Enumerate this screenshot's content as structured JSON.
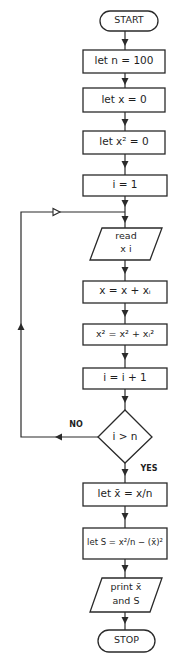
{
  "diagram": {
    "type": "flowchart",
    "title": "",
    "colors": {
      "stroke": "#2a2a2a",
      "fill": "#ffffff",
      "text": "#1e1e1e"
    },
    "nodes": [
      {
        "id": "start",
        "shape": "terminator",
        "label": "START"
      },
      {
        "id": "n",
        "shape": "process",
        "label": "let n = 100"
      },
      {
        "id": "x0",
        "shape": "process",
        "label": "let x = 0"
      },
      {
        "id": "x2_0",
        "shape": "process",
        "label": "let x² = 0"
      },
      {
        "id": "i1",
        "shape": "process",
        "label": "i = 1"
      },
      {
        "id": "read",
        "shape": "io",
        "label_line1": "read",
        "label_line2": "x i"
      },
      {
        "id": "sum",
        "shape": "process",
        "label": "x = x + xᵢ"
      },
      {
        "id": "sumsq",
        "shape": "process",
        "label": "x² = x² + xᵢ²"
      },
      {
        "id": "inc",
        "shape": "process",
        "label": "i = i + 1"
      },
      {
        "id": "cond",
        "shape": "decision",
        "label": "i > n"
      },
      {
        "id": "mean",
        "shape": "process",
        "label": "let x̄ = x/n"
      },
      {
        "id": "var",
        "shape": "process",
        "label": "let S = x²/n − (x̄)²"
      },
      {
        "id": "print",
        "shape": "io",
        "label_line1": "print x̄",
        "label_line2": "and S"
      },
      {
        "id": "stop",
        "shape": "terminator",
        "label": "STOP"
      }
    ],
    "edges": [
      {
        "from": "start",
        "to": "n"
      },
      {
        "from": "n",
        "to": "x0"
      },
      {
        "from": "x0",
        "to": "x2_0"
      },
      {
        "from": "x2_0",
        "to": "i1"
      },
      {
        "from": "i1",
        "to": "read"
      },
      {
        "from": "read",
        "to": "sum"
      },
      {
        "from": "sum",
        "to": "sumsq"
      },
      {
        "from": "sumsq",
        "to": "inc"
      },
      {
        "from": "inc",
        "to": "cond"
      },
      {
        "from": "cond",
        "to": "read",
        "label": "NO"
      },
      {
        "from": "cond",
        "to": "mean",
        "label": "YES"
      },
      {
        "from": "mean",
        "to": "var"
      },
      {
        "from": "var",
        "to": "print"
      },
      {
        "from": "print",
        "to": "stop"
      }
    ],
    "branch_labels": {
      "no": "NO",
      "yes": "YES"
    }
  }
}
